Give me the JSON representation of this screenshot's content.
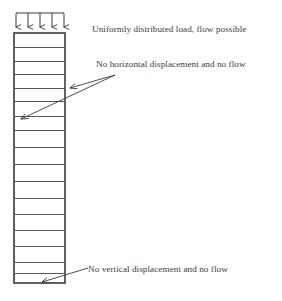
{
  "figure": {
    "kind": "geotechnical-column-mesh-diagram",
    "background_color": "#ffffff",
    "line_color": "#3b3b3b",
    "mesh_line_color": "#555555"
  },
  "annotations": {
    "top_load": {
      "text": "Uniformly distributed load, flow possible",
      "icon": "down-arrow-array-icon",
      "arrow_count": 5
    },
    "side_boundary": {
      "text": "No horizontal displacement and no flow",
      "icon": "leader-arrow-icon",
      "leader_count": 2
    },
    "base_boundary": {
      "text": "No vertical displacement and no flow",
      "icon": "leader-arrow-icon",
      "leader_count": 1
    }
  },
  "column": {
    "left_x": 14,
    "right_x": 65,
    "top_y": 33,
    "bottom_y": 283,
    "row_divider_y": [
      47,
      61,
      74,
      88,
      101,
      116,
      130,
      147,
      164,
      181,
      198,
      214,
      230,
      246,
      262,
      273
    ],
    "row_count": 17
  },
  "load_arrows": {
    "bar_y": 13,
    "bar_left_x": 16,
    "bar_right_x": 64,
    "tip_y": 32,
    "x_positions": [
      16,
      28,
      40,
      52,
      64
    ]
  },
  "leaders": {
    "side_origin": [
      115,
      75
    ],
    "side_targets": [
      [
        66,
        88
      ],
      [
        17,
        119
      ]
    ],
    "base_origin": [
      88,
      268
    ],
    "base_target": [
      38,
      283
    ]
  }
}
